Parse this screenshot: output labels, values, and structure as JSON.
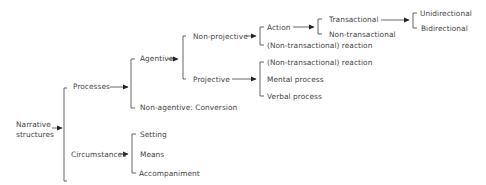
{
  "diagram": {
    "root": "Narrative structures",
    "root_line1": "Narrative",
    "root_line2": "structures",
    "nodes": {
      "processes": "Processes",
      "circumstances": "Circumstances",
      "agentive": "Agentive",
      "non_agentive": "Non-agentive: Conversion",
      "non_projective": "Non-projective",
      "projective": "Projective",
      "action": "Action",
      "np_reaction": "(Non-transactional) reaction",
      "transactional": "Transactional",
      "non_transactional": "Non-transactional",
      "unidirectional": "Unidirectional",
      "bidirectional": "Bidirectional",
      "p_reaction": "(Non-transactional) reaction",
      "mental_process": "Mental process",
      "verbal_process": "Verbal process",
      "setting": "Setting",
      "means": "Means",
      "accompaniment": "Accompaniment"
    },
    "colors": {
      "line": "#333333",
      "text": "#444444",
      "background": "#ffffff"
    }
  }
}
